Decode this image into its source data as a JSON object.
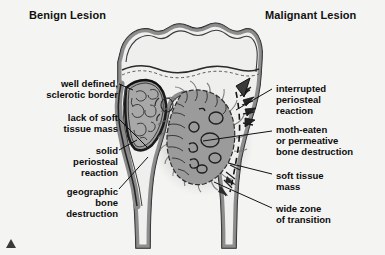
{
  "figure": {
    "background_color": "#f4f4f2",
    "title_left": "Benign Lesion",
    "title_right": "Malignant Lesion"
  },
  "palette": {
    "outline": "#1b1b1b",
    "cortex_gray": "#8d8d8d",
    "marrow_light": "#efefee",
    "lesion_fill": "#9a9a9a",
    "lesion_fill_light": "#ababab",
    "soft_tissue_halo": "#c9c9c9",
    "text": "#0c0c0c",
    "marker": "#3a3a3a"
  },
  "labels_left": [
    {
      "id": "well-defined-sclerotic-border",
      "lines": [
        "well defined,",
        "sclerotic border"
      ]
    },
    {
      "id": "lack-of-soft-tissue-mass",
      "lines": [
        "lack of soft",
        "tissue mass"
      ]
    },
    {
      "id": "solid-periosteal-reaction",
      "lines": [
        "solid",
        "periosteal",
        "reaction"
      ]
    },
    {
      "id": "geographic-bone-destruction",
      "lines": [
        "geographic",
        "bone",
        "destruction"
      ]
    }
  ],
  "labels_right": [
    {
      "id": "interrupted-periosteal-reaction",
      "lines": [
        "interrupted",
        "periosteal",
        "reaction"
      ]
    },
    {
      "id": "moth-eaten-bone-destruction",
      "lines": [
        "moth-eaten",
        "or permeative",
        "bone destruction"
      ]
    },
    {
      "id": "soft-tissue-mass",
      "lines": [
        "soft tissue",
        "mass"
      ]
    },
    {
      "id": "wide-zone-of-transition",
      "lines": [
        "wide zone",
        "of transition"
      ]
    }
  ],
  "anatomy": {
    "bone": "long bone proximal end, epiphysis with growth plate, metaphysis and diaphysis, coronal cut-away",
    "benign_lesion": "well circumscribed lucent lesion with sclerotic rim in left metaphysis",
    "malignant_lesion": "ill-defined permeative lesion with wide zone of transition in right metaphysis"
  },
  "marker": {
    "shape": "triangle-up"
  }
}
